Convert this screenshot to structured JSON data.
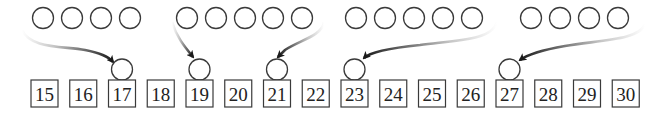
{
  "diagram": {
    "type": "number-line-grouping",
    "colors": {
      "stroke": "#3a3a3a",
      "arrow": "#1a1a1a",
      "text": "#222222",
      "background": "#ffffff"
    },
    "numbers": [
      15,
      16,
      17,
      18,
      19,
      20,
      21,
      22,
      23,
      24,
      25,
      26,
      27,
      28,
      29,
      30
    ],
    "groups": [
      {
        "label": "group-1",
        "circle_count": 4,
        "centers_x": [
          43,
          72,
          101,
          130
        ],
        "target_number": 17,
        "curve_side": "left"
      },
      {
        "label": "group-2",
        "circle_count": 5,
        "centers_x": [
          187,
          216,
          245,
          273,
          302
        ],
        "target_number": 19,
        "curve_side": "left"
      },
      {
        "label": "group-2b",
        "circle_count": 0,
        "centers_x": [],
        "target_number": 21,
        "curve_side": "right"
      },
      {
        "label": "group-3",
        "circle_count": 5,
        "centers_x": [
          356,
          385,
          414,
          443,
          472
        ],
        "target_number": 23,
        "curve_side": "right"
      },
      {
        "label": "group-4",
        "circle_count": 4,
        "centers_x": [
          531,
          560,
          589,
          618
        ],
        "target_number": 27,
        "curve_side": "right"
      }
    ],
    "marked_numbers": [
      17,
      19,
      21,
      23,
      27
    ]
  }
}
